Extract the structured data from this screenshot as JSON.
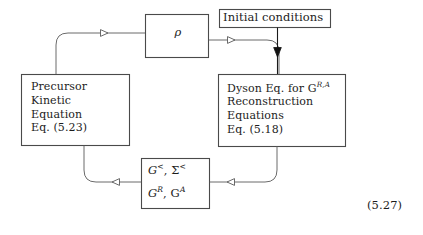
{
  "figure": {
    "type": "flow-diagram",
    "equation_number": "(5.27)",
    "nodes": [
      {
        "id": "rho",
        "name": "rho-box",
        "label": "ρ",
        "shape": "rectangle"
      },
      {
        "id": "initial_conditions",
        "name": "initial-conditions-box",
        "label": "Initial conditions",
        "shape": "rectangle"
      },
      {
        "id": "precursor",
        "name": "precursor-kinetic-equation-box",
        "lines": [
          "Precursor",
          "Kinetic",
          "Equation",
          "Eq. (5.23)"
        ],
        "shape": "rectangle"
      },
      {
        "id": "dyson",
        "name": "dyson-equation-box",
        "lines": [
          "Dyson Eq. for G",
          "Reconstruction",
          "Equations",
          "Eq. (5.18)"
        ],
        "superscript": "R,A",
        "shape": "rectangle"
      },
      {
        "id": "greens",
        "name": "greens-functions-box",
        "line1_base": "G",
        "line1_sup1": "<",
        "line1_mid": ", Σ",
        "line1_sup2": "<",
        "line2_base": "G",
        "line2_sup1": "R",
        "line2_mid": ", G",
        "line2_sup2": "A",
        "shape": "rectangle"
      }
    ],
    "edges": [
      {
        "name": "edge-precursor-to-rho",
        "from": "precursor",
        "to": "rho",
        "arrow": "hollow-right"
      },
      {
        "name": "edge-rho-to-dyson",
        "from": "rho",
        "to": "dyson",
        "arrow": "hollow-right"
      },
      {
        "name": "edge-initial-to-dyson",
        "from": "initial_conditions",
        "to": "dyson",
        "arrow": "solid-down"
      },
      {
        "name": "edge-dyson-to-greens",
        "from": "dyson",
        "to": "greens",
        "arrow": "hollow-left"
      },
      {
        "name": "edge-greens-to-precursor",
        "from": "greens",
        "to": "precursor",
        "arrow": "hollow-left"
      }
    ],
    "colors": {
      "background": "#ffffff",
      "box_stroke": "#4a4a4a",
      "line_stroke": "#5a5a5a",
      "text": "#1c1c1c"
    }
  }
}
